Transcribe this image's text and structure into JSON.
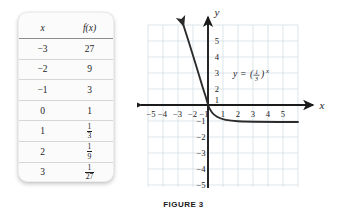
{
  "figure": {
    "caption": "FIGURE 3"
  },
  "table": {
    "headers": [
      "x",
      "f(x)"
    ],
    "rows": [
      {
        "x": "−3",
        "fx": "27",
        "fx_is_fraction": false
      },
      {
        "x": "−2",
        "fx": "9",
        "fx_is_fraction": false
      },
      {
        "x": "−1",
        "fx": "3",
        "fx_is_fraction": false
      },
      {
        "x": "0",
        "fx": "1",
        "fx_is_fraction": false
      },
      {
        "x": "1",
        "fx_num": "1",
        "fx_den": "3",
        "fx_is_fraction": true
      },
      {
        "x": "2",
        "fx_num": "1",
        "fx_den": "9",
        "fx_is_fraction": true
      },
      {
        "x": "3",
        "fx_num": "1",
        "fx_den": "27",
        "fx_is_fraction": true
      }
    ]
  },
  "chart_data": {
    "type": "line",
    "title": "",
    "equation_label": "y = (1/3)^x",
    "equation_parts": {
      "lhs": "y",
      "eq": "=",
      "open_paren": "(",
      "frac_num": "1",
      "frac_den": "3",
      "close_paren": ")",
      "exponent": "x"
    },
    "xlabel": "x",
    "ylabel": "y",
    "xlim": [
      -6,
      6
    ],
    "ylim": [
      -6,
      6
    ],
    "grid": true,
    "grid_color": "#cfdbe4",
    "axis_color": "#1b1b1b",
    "curve_color": "#2b2b2b",
    "x_ticks": [
      "−5",
      "−4",
      "−3",
      "−2",
      "−1",
      "1",
      "2",
      "3",
      "4",
      "5"
    ],
    "x_tick_values": [
      -5,
      -4,
      -3,
      -2,
      -1,
      1,
      2,
      3,
      4,
      5
    ],
    "y_ticks": [
      "5",
      "4",
      "3",
      "2",
      "1",
      "−1",
      "−2",
      "−3",
      "−4",
      "−5"
    ],
    "y_tick_values": [
      5,
      4,
      3,
      2,
      1,
      -1,
      -2,
      -3,
      -4,
      -5
    ],
    "series": [
      {
        "name": "y = (1/3)^x",
        "x": [
          -1.7,
          -1.6,
          -1.5,
          -1.4,
          -1.3,
          -1.2,
          -1.1,
          -1.0,
          -0.9,
          -0.8,
          -0.7,
          -0.6,
          -0.5,
          -0.4,
          -0.3,
          -0.2,
          -0.1,
          0,
          0.25,
          0.5,
          0.75,
          1,
          1.5,
          2,
          2.5,
          3,
          3.5,
          4,
          4.5,
          5,
          5.5
        ],
        "y": [
          6.47,
          5.8,
          5.2,
          4.66,
          4.17,
          3.74,
          3.35,
          3.0,
          2.69,
          2.41,
          2.16,
          1.93,
          1.73,
          1.55,
          1.39,
          1.25,
          1.12,
          1.0,
          0.76,
          0.577,
          0.439,
          0.333,
          0.192,
          0.111,
          0.064,
          0.037,
          0.021,
          0.0123,
          0.0071,
          0.0041,
          0.0024
        ]
      }
    ],
    "annotations": [
      {
        "text": "y = (1/3)^x",
        "x": 2.4,
        "y": 2.55
      }
    ]
  }
}
